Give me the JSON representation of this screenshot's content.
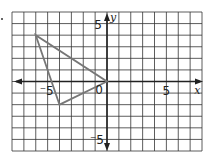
{
  "diagram": {
    "type": "coordinate-grid",
    "axes": {
      "x_label": "x",
      "y_label": "y",
      "x_range": [
        -8,
        8
      ],
      "y_range": [
        -6,
        6
      ],
      "grid_step": 1,
      "tick_labels": {
        "x_neg5": "⁻5",
        "x_pos5": "5",
        "y_pos5": "5",
        "y_neg5": "⁻5",
        "origin": "0"
      }
    },
    "shapes": [
      {
        "type": "triangle",
        "vertices": [
          [
            -6,
            4
          ],
          [
            -4,
            -2
          ],
          [
            0,
            0
          ]
        ],
        "stroke": "#777777"
      }
    ],
    "colors": {
      "grid": "#333333",
      "axes": "#222222",
      "shape": "#777777"
    }
  }
}
